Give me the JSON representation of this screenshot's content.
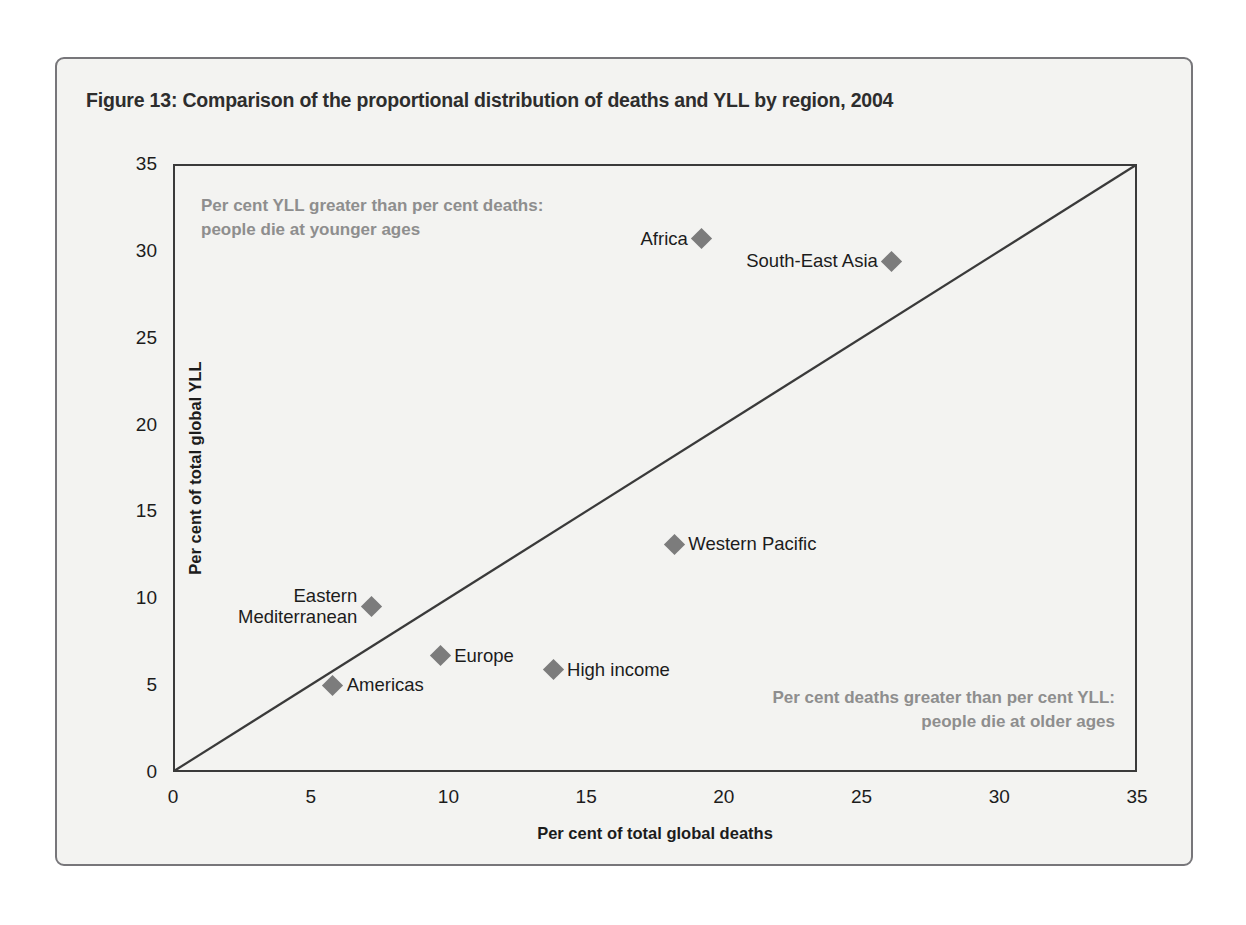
{
  "figure": {
    "title": "Figure 13: Comparison of the proportional distribution of deaths and YLL by region, 2004"
  },
  "annotations": {
    "upper_left": "Per cent YLL greater than per cent deaths:\npeople die at younger ages",
    "lower_right": "Per cent deaths greater than per cent YLL:\npeople die at older ages"
  },
  "chart_data": {
    "type": "scatter",
    "title": "Figure 13: Comparison of the proportional distribution of deaths and YLL by region, 2004",
    "xlabel": "Per cent of total global deaths",
    "ylabel": "Per cent of total global YLL",
    "xlim": [
      0,
      35
    ],
    "ylim": [
      0,
      35
    ],
    "xticks": [
      "0",
      "5",
      "10",
      "15",
      "20",
      "25",
      "30",
      "35"
    ],
    "yticks": [
      "0",
      "5",
      "10",
      "15",
      "20",
      "25",
      "30",
      "35"
    ],
    "grid": false,
    "legend": "none",
    "reference_line": {
      "name": "identity-line",
      "from": [
        0,
        0
      ],
      "to": [
        35,
        35
      ]
    },
    "marker_color": "#7c7c7c",
    "points": [
      {
        "label": "Africa",
        "x": 19.2,
        "y": 30.7,
        "label_side": "left",
        "label_lines": [
          "Africa"
        ]
      },
      {
        "label": "South-East Asia",
        "x": 26.1,
        "y": 29.4,
        "label_side": "left",
        "label_lines": [
          "South-East Asia"
        ]
      },
      {
        "label": "Western Pacific",
        "x": 18.2,
        "y": 13.1,
        "label_side": "right",
        "label_lines": [
          "Western Pacific"
        ]
      },
      {
        "label": "Eastern Mediterranean",
        "x": 7.2,
        "y": 9.5,
        "label_side": "left",
        "label_lines": [
          "Eastern",
          "Mediterranean"
        ]
      },
      {
        "label": "Europe",
        "x": 9.7,
        "y": 6.7,
        "label_side": "right",
        "label_lines": [
          "Europe"
        ]
      },
      {
        "label": "High income",
        "x": 13.8,
        "y": 5.9,
        "label_side": "right",
        "label_lines": [
          "High income"
        ]
      },
      {
        "label": "Americas",
        "x": 5.8,
        "y": 5.0,
        "label_side": "right",
        "label_lines": [
          "Americas"
        ]
      }
    ]
  }
}
